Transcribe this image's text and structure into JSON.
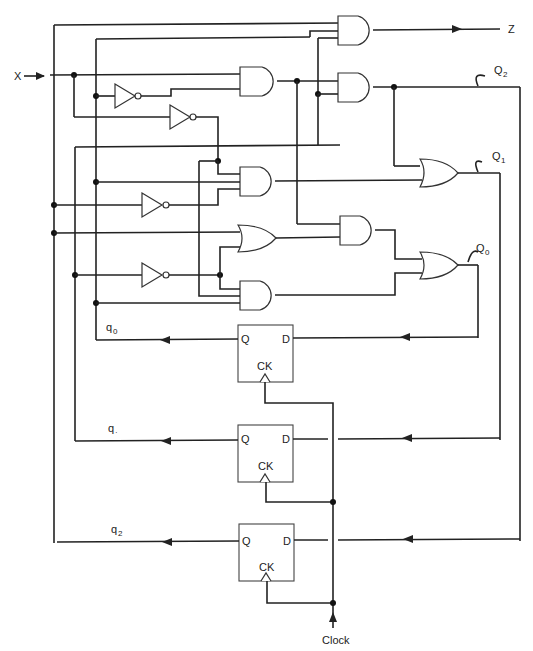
{
  "diagram": {
    "type": "sequential logic circuit",
    "inputs": {
      "x": "X",
      "clock": "Clock"
    },
    "outputs": {
      "z": "Z"
    },
    "next_state_labels": {
      "Q2": "Q",
      "Q2_sub": "2",
      "Q1": "Q",
      "Q1_sub": "1",
      "Q0": "Q",
      "Q0_sub": "0"
    },
    "state_labels": {
      "q0": "q",
      "q0_sub": "0",
      "q1": "q",
      "q1_sub": "·",
      "q2": "q",
      "q2_sub": "2"
    },
    "flip_flops": [
      {
        "name": "FF0",
        "q": "Q",
        "d": "D",
        "ck": "CK"
      },
      {
        "name": "FF1",
        "q": "Q",
        "d": "D",
        "ck": "CK"
      },
      {
        "name": "FF2",
        "q": "Q",
        "d": "D",
        "ck": "CK"
      }
    ],
    "gates": {
      "and_count": 6,
      "or_count": 3,
      "not_count": 4
    }
  }
}
